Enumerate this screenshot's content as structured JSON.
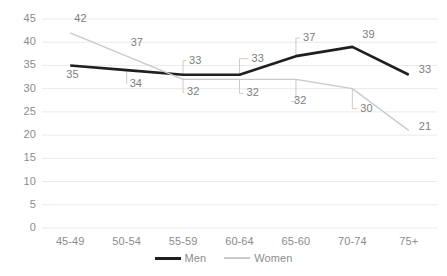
{
  "chart_data": {
    "type": "line",
    "title": "",
    "subtitle": "",
    "xlabel": "",
    "ylabel": "",
    "categories": [
      "45-49",
      "50-54",
      "55-59",
      "60-64",
      "65-60",
      "70-74",
      "75+"
    ],
    "series": [
      {
        "name": "Men",
        "color": "#1f1f1f",
        "values": [
          35,
          34,
          33,
          33,
          37,
          39,
          33
        ]
      },
      {
        "name": "Women",
        "color": "#c9c9c9",
        "values": [
          42,
          37,
          32,
          32,
          32,
          30,
          21
        ]
      }
    ],
    "ylim": [
      0,
      45
    ],
    "ytick_step": 5,
    "yticks": [
      45,
      40,
      35,
      30,
      25,
      20,
      15,
      10,
      5,
      0
    ],
    "grid": "horizontal",
    "legend_position": "bottom-center",
    "data_labels": true
  },
  "axis": {
    "y_tick_labels": [
      "45",
      "40",
      "35",
      "30",
      "25",
      "20",
      "15",
      "10",
      "5",
      "0"
    ],
    "x_tick_labels": [
      "45-49",
      "50-54",
      "55-59",
      "60-64",
      "65-60",
      "70-74",
      "75+"
    ]
  },
  "legend": {
    "items": [
      {
        "label": "Men"
      },
      {
        "label": "Women"
      }
    ]
  },
  "labels": {
    "men": [
      "35",
      "34",
      "33",
      "33",
      "37",
      "39",
      "33"
    ],
    "women": [
      "42",
      "37",
      "32",
      "32",
      "32",
      "30",
      "21"
    ]
  },
  "colors": {
    "men_line": "#1f1f1f",
    "women_line": "#c9c9c9",
    "gridline": "#eaeaea",
    "tick_text": "#8c8c8c",
    "label_text": "#7d7d7d",
    "background": "#ffffff"
  }
}
